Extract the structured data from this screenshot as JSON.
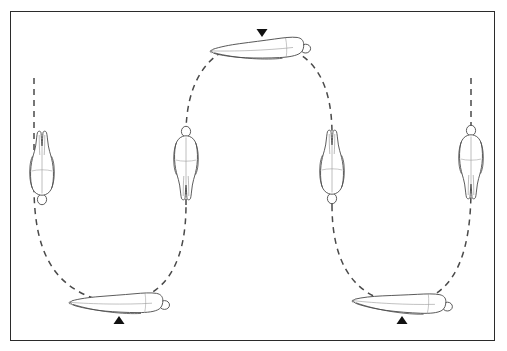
{
  "document": {
    "title": "Tumbling Trajectory Diagram",
    "background_color": "#ffffff",
    "frame_border_color": "#2b2b2b",
    "line_color": "#4a4a4a",
    "marker_color": "#111111",
    "caption_fragment": ""
  },
  "frame": {
    "x": 10,
    "y": 11,
    "width": 485,
    "height": 330
  },
  "markers": [
    {
      "id": "marker-top-center",
      "label": "apex-marker",
      "direction": "down",
      "x": 262,
      "y": 33,
      "size": 11
    },
    {
      "id": "marker-bottom-left",
      "label": "left-contact-marker",
      "direction": "up",
      "x": 119,
      "y": 320,
      "size": 11
    },
    {
      "id": "marker-bottom-right",
      "label": "right-contact-marker",
      "direction": "up",
      "x": 402,
      "y": 320,
      "size": 11
    }
  ],
  "path": {
    "stroke_dasharray": "6 5",
    "stroke_width": 1.5,
    "segments": [
      {
        "name": "left-ascender",
        "d": "M 34,78 L 34,150"
      },
      {
        "name": "left-descender-curve",
        "d": "M 34,186 C 34,250 52,292 112,303"
      },
      {
        "name": "left-rise-curve",
        "d": "M 133,300 C 170,292 186,256 186,205"
      },
      {
        "name": "center-left-vertical",
        "d": "M 186,205 L 186,178"
      },
      {
        "name": "center-left-upper",
        "d": "M 186,134 C 186,84 206,54 238,45"
      },
      {
        "name": "apex-span",
        "d": "M 238,45 L 283,47"
      },
      {
        "name": "center-right-upper",
        "d": "M 283,47 C 316,56 332,86 332,134"
      },
      {
        "name": "center-right-vertical",
        "d": "M 332,178 L 332,205"
      },
      {
        "name": "right-descender-curve",
        "d": "M 332,205 C 332,258 350,294 394,303"
      },
      {
        "name": "right-rise-curve",
        "d": "M 417,302 C 456,292 471,252 471,188"
      },
      {
        "name": "right-ascender",
        "d": "M 471,150 L 471,74"
      }
    ]
  },
  "figures": [
    {
      "id": "figure-1",
      "name": "figure-left-inverted",
      "pose": "vertical-inverted",
      "description": "body aligned vertically, head downward",
      "cx": 42,
      "cy": 167,
      "rotation": 0,
      "scale": 1.0,
      "orientation": "head-down"
    },
    {
      "id": "figure-2",
      "name": "figure-bottom-left-horizontal",
      "pose": "horizontal-prone",
      "description": "body horizontal at lowest point of left arc",
      "cx": 119,
      "cy": 302,
      "rotation": 0,
      "scale": 1.0,
      "orientation": "feet-left-head-right"
    },
    {
      "id": "figure-3",
      "name": "figure-center-left-upright",
      "pose": "vertical-upright",
      "description": "body aligned vertically, head upward",
      "cx": 186,
      "cy": 164,
      "rotation": 0,
      "scale": 1.0,
      "orientation": "head-up"
    },
    {
      "id": "figure-4",
      "name": "figure-apex-horizontal",
      "pose": "horizontal-prone",
      "description": "body horizontal at top apex of arc",
      "cx": 260,
      "cy": 48,
      "rotation": -3,
      "scale": 1.0,
      "orientation": "feet-left-head-right"
    },
    {
      "id": "figure-5",
      "name": "figure-center-right-inverted",
      "pose": "vertical-inverted",
      "description": "body aligned vertically, head downward",
      "cx": 332,
      "cy": 166,
      "rotation": 0,
      "scale": 1.0,
      "orientation": "head-down"
    },
    {
      "id": "figure-6",
      "name": "figure-bottom-right-horizontal",
      "pose": "horizontal-prone",
      "description": "body horizontal at lowest point of right arc",
      "cx": 402,
      "cy": 302,
      "rotation": 2,
      "scale": 1.0,
      "orientation": "feet-left-head-right"
    },
    {
      "id": "figure-7",
      "name": "figure-right-upright",
      "pose": "vertical-upright",
      "description": "body aligned vertically, head upward",
      "cx": 471,
      "cy": 163,
      "rotation": 0,
      "scale": 1.0,
      "orientation": "head-up"
    }
  ]
}
